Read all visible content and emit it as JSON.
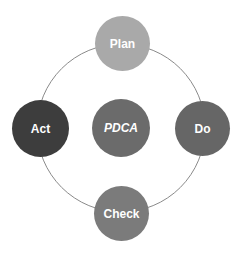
{
  "diagram": {
    "type": "cycle",
    "center": {
      "label": "PDCA",
      "color": "#6b6b6b"
    },
    "ring": {
      "stroke": "#8a8a8a"
    },
    "nodes": [
      {
        "id": "plan",
        "label": "Plan",
        "position": "top",
        "color": "#a9a9a9"
      },
      {
        "id": "do",
        "label": "Do",
        "position": "right",
        "color": "#666666"
      },
      {
        "id": "check",
        "label": "Check",
        "position": "bottom",
        "color": "#7b7b7b"
      },
      {
        "id": "act",
        "label": "Act",
        "position": "left",
        "color": "#3d3d3d"
      }
    ]
  }
}
